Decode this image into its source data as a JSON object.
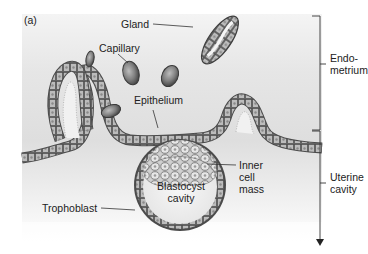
{
  "figure": {
    "panel_label": "(a)"
  },
  "labels": {
    "gland": "Gland",
    "capillary": "Capillary",
    "epithelium": "Epithelium",
    "inner_cell_mass_1": "Inner",
    "inner_cell_mass_2": "cell",
    "inner_cell_mass_3": "mass",
    "blastocyst_cavity_1": "Blastocyst",
    "blastocyst_cavity_2": "cavity",
    "trophoblast": "Trophoblast"
  },
  "regions": {
    "endometrium_1": "Endo-",
    "endometrium_2": "metrium",
    "uterine_cavity_1": "Uterine",
    "uterine_cavity_2": "cavity"
  },
  "colors": {
    "tissue_bg": "#e4e4e4",
    "cell_fill": "#b9b9b9",
    "cell_dark": "#6f6f6f",
    "capillary": "#7c7c7c",
    "line": "#333333"
  }
}
